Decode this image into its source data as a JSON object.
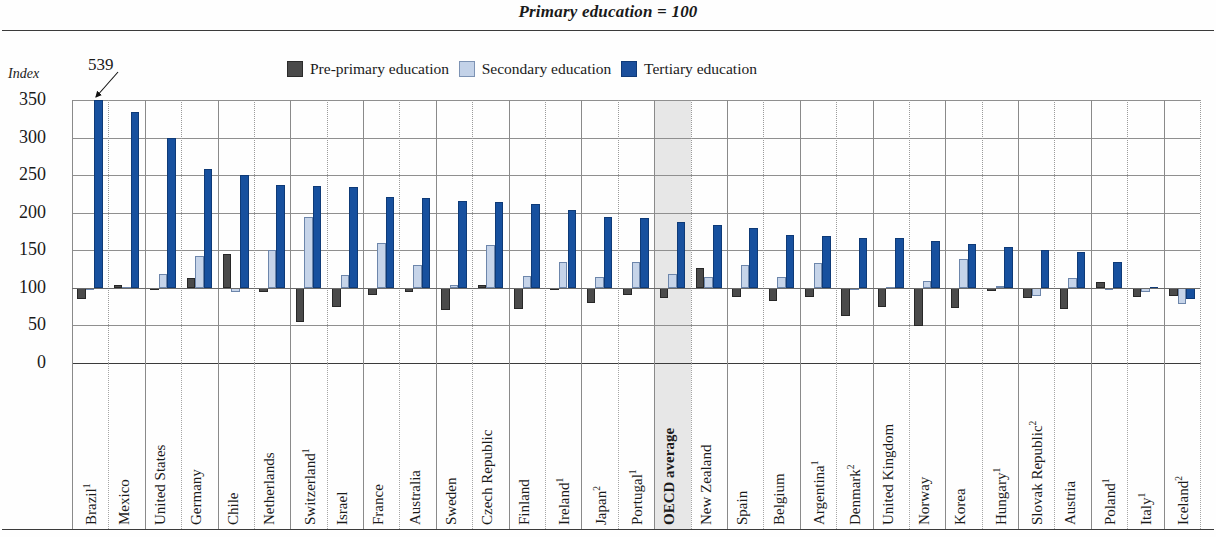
{
  "title": "Primary education = 100",
  "axis_unit_label": "Index",
  "legend": [
    {
      "key": "pre",
      "label": "Pre-primary education",
      "color": "#4a4a4a"
    },
    {
      "key": "sec",
      "label": "Secondary education",
      "color": "#c6d4e9"
    },
    {
      "key": "ter",
      "label": "Tertiary education",
      "color": "#17509e"
    }
  ],
  "annotation": {
    "value": "539",
    "target_category": "Brazil"
  },
  "highlight": {
    "category": "OECD average",
    "color": "#e3e3e3"
  },
  "chart_data": {
    "type": "bar",
    "title": "Primary education = 100",
    "xlabel": "",
    "ylabel": "Index",
    "ylim": [
      0,
      350
    ],
    "yticks": [
      0,
      50,
      100,
      150,
      200,
      250,
      300,
      350
    ],
    "grid": true,
    "legend_position": "top",
    "note": "Tertiary education bar for Brazil is clipped at the 350 axis maximum; its true value is 539.",
    "categories": [
      "Brazil¹",
      "Mexico",
      "United States",
      "Germany",
      "Chile",
      "Netherlands",
      "Switzerland¹",
      "Israel",
      "France",
      "Australia",
      "Sweden",
      "Czech Republic",
      "Finland",
      "Ireland¹",
      "Japan²",
      "Portugal¹",
      "OECD average",
      "New Zealand",
      "Spain",
      "Belgium",
      "Argentina¹",
      "Denmark²",
      "United Kingdom",
      "Norway",
      "Korea",
      "Hungary¹",
      "Slovak Republic²",
      "Austria",
      "Poland¹",
      "Italy¹",
      "Iceland²"
    ],
    "series": [
      {
        "name": "Pre-primary education",
        "color": "#4a4a4a",
        "values": [
          85,
          104,
          98,
          113,
          145,
          95,
          54,
          74,
          91,
          95,
          70,
          104,
          72,
          98,
          80,
          90,
          87,
          127,
          88,
          82,
          88,
          62,
          75,
          49,
          73,
          96,
          87,
          72,
          108,
          88,
          89
        ]
      },
      {
        "name": "Secondary education",
        "color": "#c6d4e9",
        "values": [
          98,
          101,
          118,
          143,
          94,
          150,
          194,
          117,
          160,
          131,
          104,
          157,
          116,
          135,
          115,
          135,
          118,
          114,
          130,
          115,
          133,
          99,
          101,
          109,
          138,
          102,
          89,
          113,
          99,
          95,
          79
        ]
      },
      {
        "name": "Tertiary education",
        "color": "#17509e",
        "values": [
          350,
          334,
          299,
          258,
          250,
          237,
          236,
          234,
          221,
          220,
          216,
          214,
          211,
          204,
          194,
          193,
          187,
          183,
          179,
          170,
          169,
          167,
          167,
          162,
          159,
          154,
          150,
          148,
          135,
          101,
          85
        ]
      }
    ]
  }
}
